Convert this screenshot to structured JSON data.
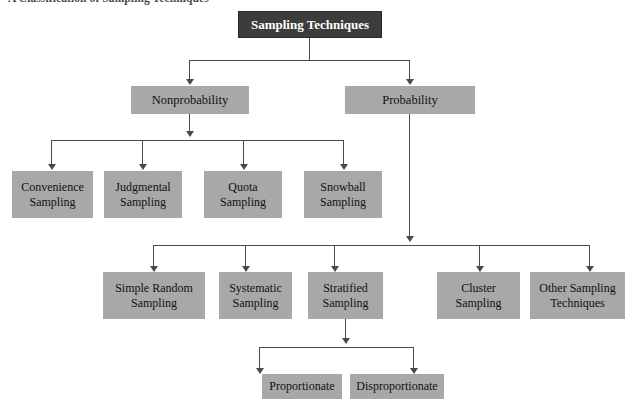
{
  "figure": {
    "caption": "A Classification of Sampling Techniques",
    "colors": {
      "root_fill": "#3c3c3c",
      "root_text": "#ffffff",
      "node_fill": "#a8a8a8",
      "node_text": "#111111",
      "connector": "#4a4a4a",
      "background": "#ffffff"
    }
  },
  "diagram": {
    "type": "tree",
    "root": {
      "label": "Sampling Techniques"
    },
    "level2": [
      {
        "label": "Nonprobability"
      },
      {
        "label": "Probability"
      }
    ],
    "nonprobability_children": [
      {
        "line1": "Convenience",
        "line2": "Sampling"
      },
      {
        "line1": "Judgmental",
        "line2": "Sampling"
      },
      {
        "line1": "Quota",
        "line2": "Sampling"
      },
      {
        "line1": "Snowball",
        "line2": "Sampling"
      }
    ],
    "probability_children": [
      {
        "line1": "Simple Random",
        "line2": "Sampling"
      },
      {
        "line1": "Systematic",
        "line2": "Sampling"
      },
      {
        "line1": "Stratified",
        "line2": "Sampling"
      },
      {
        "line1": "Cluster",
        "line2": "Sampling"
      },
      {
        "line1": "Other Sampling",
        "line2": "Techniques"
      }
    ],
    "stratified_children": [
      {
        "label": "Proportionate"
      },
      {
        "label": "Disproportionate"
      }
    ]
  }
}
